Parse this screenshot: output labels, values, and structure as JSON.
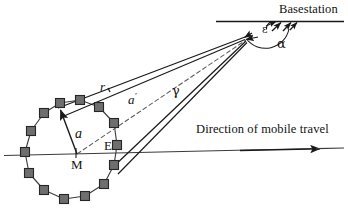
{
  "figure": {
    "kind": "geometry-diagram",
    "domain": "wireless-propagation-scattering-model",
    "background_color": "#ffffff",
    "ink_color": "#1a1a1a",
    "scatterer_fill": "#6e6e6e",
    "scatterer_stroke": "#262626",
    "width": 348,
    "height": 212
  },
  "labels": {
    "basestation": "Basestation",
    "direction_of_travel": "Direction of mobile travel",
    "mobile_center": "M",
    "ellipse_point": "E",
    "radius_a": "a",
    "radius_a_prime": "a",
    "radius_a_prime_mark": "′",
    "distance_r": "r",
    "angle_gamma": "γ",
    "angle_epsilon": "ε",
    "angle_alpha": "α"
  },
  "geometry": {
    "basestation_point": {
      "x": 276,
      "y": 22
    },
    "convergence_point": {
      "x": 244,
      "y": 38
    },
    "mobile_center_M": {
      "x": 76,
      "y": 155
    },
    "point_E": {
      "x": 110,
      "y": 149
    },
    "ring_center": {
      "x": 74,
      "y": 155
    },
    "ring_radius_x": 55,
    "ring_radius_y": 52,
    "scatterer_count": 14,
    "scatterer_size": 9,
    "horizontal_axis": {
      "x1": 4,
      "y1": 156,
      "x2": 344,
      "y2": 148
    },
    "basestation_baseline": {
      "x1": 216,
      "y1": 22,
      "x2": 344,
      "y2": 22
    }
  },
  "scatterers": [
    {
      "id": 1,
      "x": 60,
      "y": 103
    },
    {
      "id": 2,
      "x": 80,
      "y": 100
    },
    {
      "id": 3,
      "x": 99,
      "y": 107
    },
    {
      "id": 4,
      "x": 114,
      "y": 123
    },
    {
      "id": 5,
      "x": 117,
      "y": 145
    },
    {
      "id": 6,
      "x": 114,
      "y": 165
    },
    {
      "id": 7,
      "x": 104,
      "y": 184
    },
    {
      "id": 8,
      "x": 85,
      "y": 196
    },
    {
      "id": 9,
      "x": 64,
      "y": 199
    },
    {
      "id": 10,
      "x": 44,
      "y": 190
    },
    {
      "id": 11,
      "x": 29,
      "y": 173
    },
    {
      "id": 12,
      "x": 25,
      "y": 152
    },
    {
      "id": 13,
      "x": 31,
      "y": 131
    },
    {
      "id": 14,
      "x": 44,
      "y": 113
    }
  ],
  "rays": [
    {
      "name": "r-ray",
      "from": "scatterer-1",
      "to": "convergence-point",
      "label": "r",
      "style": "solid"
    },
    {
      "name": "a-prime-ray",
      "from": "mobile-center",
      "to": "convergence-point",
      "label": "a′",
      "style": "dashed"
    },
    {
      "name": "gamma-ray",
      "from": "scatterer-6",
      "to": "convergence-point",
      "label": "γ",
      "style": "solid"
    },
    {
      "name": "a-vector",
      "from": "mobile-center",
      "to": "scatterer-1",
      "label": "a",
      "style": "solid-arrow"
    }
  ],
  "angles": [
    {
      "name": "epsilon",
      "symbol": "ε",
      "at": "basestation",
      "description": "angle between basestation baseline and rays"
    },
    {
      "name": "alpha",
      "symbol": "α",
      "at": "basestation",
      "description": "angular spread at basestation"
    }
  ]
}
